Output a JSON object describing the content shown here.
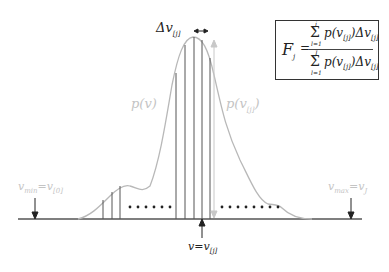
{
  "diagram": {
    "curve_label_left": "p(v)",
    "curve_label_right": "p(v_[j])",
    "delta_label": "Δv",
    "delta_sub": "[j]",
    "v_min_label": "v",
    "v_min_sub": "min",
    "v_min_eq": "=v",
    "v_min_eq_sub": "[0]",
    "v_max_label": "v",
    "v_max_sub": "max",
    "v_max_eq": "=v",
    "v_max_eq_sub": "J",
    "v_point_label": "v=v",
    "v_point_sub": "[j]",
    "colors": {
      "curve": "#b8b8b8",
      "axis": "#555555",
      "bin_lines": "#555555",
      "labels_gray": "#c4c4c4",
      "labels_black": "#222222"
    }
  },
  "formula": {
    "lhs": "F",
    "lhs_sub": "j",
    "equals": "=",
    "numerator": "p(v",
    "numerator_sub": "[j]",
    "numerator_tail": ")Δv",
    "numerator_tail_sub": "[j]",
    "num_sum_upper": "j",
    "num_sum_lower": "l=1",
    "denominator": "p(v",
    "denominator_sub": "[j]",
    "denominator_tail": ")Δv",
    "denominator_tail_sub": "[j]",
    "den_sum_upper": "J",
    "den_sum_lower": "l=1",
    "sigma": "Σ"
  }
}
